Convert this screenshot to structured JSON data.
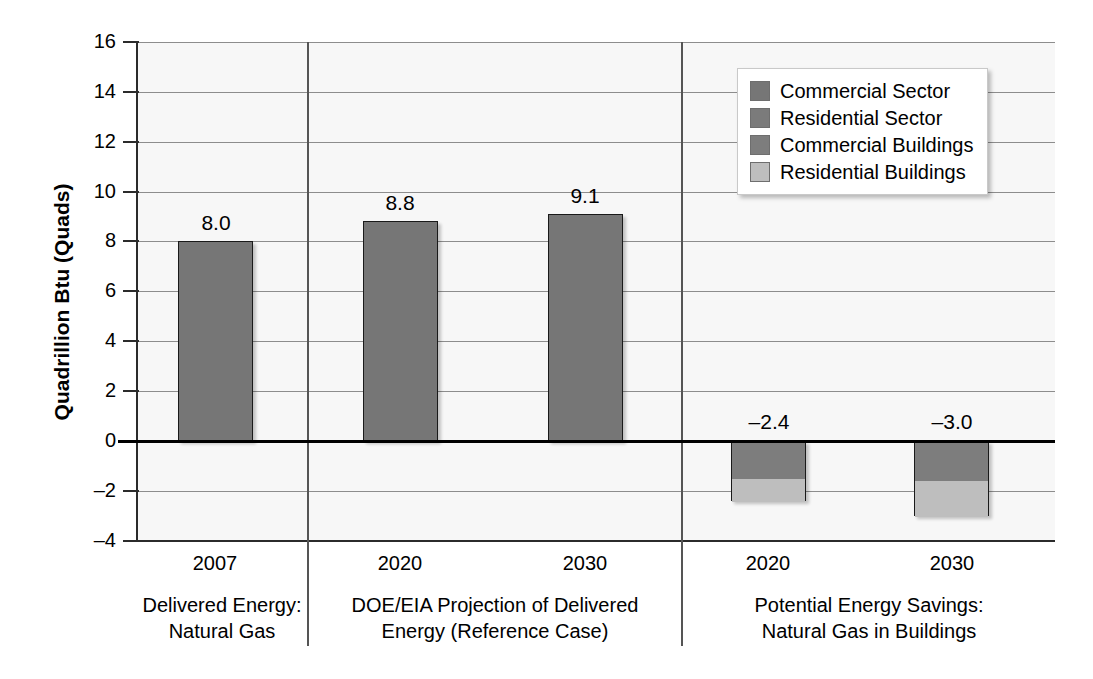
{
  "chart_data": {
    "type": "bar",
    "title": "",
    "xlabel": "",
    "ylabel": "Quadrillion Btu (Quads)",
    "ylim": [
      -4,
      16
    ],
    "yticks": [
      16,
      14,
      12,
      10,
      8,
      6,
      4,
      2,
      0,
      -2,
      -4
    ],
    "ytick_labels": [
      "16",
      "14",
      "12",
      "10",
      "8",
      "6",
      "4",
      "2",
      "0",
      "–2",
      "–4"
    ],
    "grid": true,
    "legend_position": "top-right",
    "legend": [
      {
        "label": "Commercial Sector",
        "color": "#767676"
      },
      {
        "label": "Residential Sector",
        "color": "#7b7b7b"
      },
      {
        "label": "Commercial Buildings",
        "color": "#7d7d7d"
      },
      {
        "label": "Residential Buildings",
        "color": "#bebebe"
      }
    ],
    "groups": [
      {
        "caption_line1": "Delivered Energy:",
        "caption_line2": "Natural Gas",
        "categories": [
          "2007"
        ]
      },
      {
        "caption_line1": "DOE/EIA Projection of Delivered",
        "caption_line2": "Energy (Reference Case)",
        "categories": [
          "2020",
          "2030"
        ]
      },
      {
        "caption_line1": "Potential Energy Savings:",
        "caption_line2": "Natural Gas in Buildings",
        "categories": [
          "2020",
          "2030"
        ]
      }
    ],
    "bars": [
      {
        "category": "2007",
        "group": "Delivered Energy: Natural Gas",
        "total": 8.0,
        "data_label": "8.0",
        "segments": [
          {
            "series": "Commercial Sector",
            "value": 8.0,
            "color": "#767676"
          }
        ]
      },
      {
        "category": "2020",
        "group": "DOE/EIA Projection of Delivered Energy (Reference Case)",
        "total": 8.8,
        "data_label": "8.8",
        "segments": [
          {
            "series": "Commercial Sector",
            "value": 8.8,
            "color": "#767676"
          }
        ]
      },
      {
        "category": "2030",
        "group": "DOE/EIA Projection of Delivered Energy (Reference Case)",
        "total": 9.1,
        "data_label": "9.1",
        "segments": [
          {
            "series": "Commercial Sector",
            "value": 9.1,
            "color": "#767676"
          }
        ]
      },
      {
        "category": "2020",
        "group": "Potential Energy Savings: Natural Gas in Buildings",
        "total": -2.4,
        "data_label": "–2.4",
        "segments": [
          {
            "series": "Commercial Buildings",
            "value": -1.5,
            "color": "#7d7d7d"
          },
          {
            "series": "Residential Buildings",
            "value": -0.9,
            "color": "#bebebe"
          }
        ]
      },
      {
        "category": "2030",
        "group": "Potential Energy Savings: Natural Gas in Buildings",
        "total": -3.0,
        "data_label": "–3.0",
        "segments": [
          {
            "series": "Commercial Buildings",
            "value": -1.55,
            "color": "#7d7d7d"
          },
          {
            "series": "Residential Buildings",
            "value": -1.45,
            "color": "#bebebe"
          }
        ]
      }
    ]
  },
  "axis": {
    "y_title": "Quadrillion Btu (Quads)",
    "ticks": [
      {
        "value": 16,
        "label": "16"
      },
      {
        "value": 14,
        "label": "14"
      },
      {
        "value": 12,
        "label": "12"
      },
      {
        "value": 10,
        "label": "10"
      },
      {
        "value": 8,
        "label": "8"
      },
      {
        "value": 6,
        "label": "6"
      },
      {
        "value": 4,
        "label": "4"
      },
      {
        "value": 2,
        "label": "2"
      },
      {
        "value": 0,
        "label": "0"
      },
      {
        "value": -2,
        "label": "–2"
      },
      {
        "value": -4,
        "label": "–4"
      }
    ]
  },
  "xticks": [
    "2007",
    "2020",
    "2030",
    "2020",
    "2030"
  ],
  "captions": [
    {
      "line1": "Delivered Energy:",
      "line2": "Natural Gas"
    },
    {
      "line1": "DOE/EIA Projection of Delivered",
      "line2": "Energy (Reference Case)"
    },
    {
      "line1": "Potential Energy Savings:",
      "line2": "Natural Gas in Buildings"
    }
  ],
  "data_labels": [
    "8.0",
    "8.8",
    "9.1",
    "–2.4",
    "–3.0"
  ],
  "legend_labels": [
    "Commercial Sector",
    "Residential Sector",
    "Commercial Buildings",
    "Residential Buildings"
  ]
}
